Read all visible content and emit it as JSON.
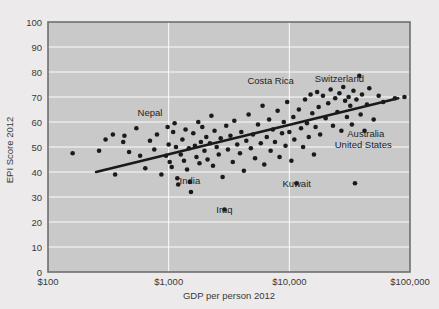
{
  "chart_data": {
    "type": "scatter",
    "title": "",
    "xlabel": "GDP per person 2012",
    "ylabel": "EPI Score 2012",
    "xscale": "log",
    "xlim": [
      100,
      100000
    ],
    "ylim": [
      0,
      100
    ],
    "grid": true,
    "legend": "none",
    "plot_bg": "#c9c9c9",
    "page_bg": "#eceaea",
    "point_color": "#1a1a1a",
    "trendline_color": "#1a1a1a",
    "xticks": [
      "$100",
      "$1,000",
      "$10,000",
      "$100,000"
    ],
    "xtick_values": [
      100,
      1000,
      10000,
      100000
    ],
    "yticks": [
      "0",
      "10",
      "20",
      "30",
      "40",
      "50",
      "60",
      "70",
      "80",
      "90",
      "100"
    ],
    "ytick_values": [
      0,
      10,
      20,
      30,
      40,
      50,
      60,
      70,
      80,
      90,
      100
    ],
    "trendline": {
      "x0": 250,
      "y0": 40.0,
      "x1": 80000,
      "y1": 69.5
    },
    "annotations": [
      {
        "label": "Nepal",
        "x": 700,
        "y": 64.0
      },
      {
        "label": "Costa Rica",
        "x": 7000,
        "y": 76.5
      },
      {
        "label": "Switzerland",
        "x": 26000,
        "y": 77.5
      },
      {
        "label": "Australia",
        "x": 43000,
        "y": 55.5
      },
      {
        "label": "United States",
        "x": 41000,
        "y": 51.0
      },
      {
        "label": "India",
        "x": 1500,
        "y": 36.5
      },
      {
        "label": "Iraq",
        "x": 2900,
        "y": 25.0
      },
      {
        "label": "Kuwait",
        "x": 11500,
        "y": 35.5
      }
    ],
    "points": [
      {
        "x": 160,
        "y": 47.5
      },
      {
        "x": 265,
        "y": 48.5
      },
      {
        "x": 300,
        "y": 53.0
      },
      {
        "x": 345,
        "y": 55.0
      },
      {
        "x": 360,
        "y": 39.0
      },
      {
        "x": 420,
        "y": 52.0
      },
      {
        "x": 430,
        "y": 54.5
      },
      {
        "x": 470,
        "y": 48.0
      },
      {
        "x": 540,
        "y": 57.5
      },
      {
        "x": 580,
        "y": 46.5
      },
      {
        "x": 640,
        "y": 41.5
      },
      {
        "x": 700,
        "y": 52.5
      },
      {
        "x": 760,
        "y": 49.0
      },
      {
        "x": 800,
        "y": 55.0
      },
      {
        "x": 870,
        "y": 39.0
      },
      {
        "x": 950,
        "y": 46.5
      },
      {
        "x": 980,
        "y": 58.0
      },
      {
        "x": 1000,
        "y": 51.0
      },
      {
        "x": 1020,
        "y": 44.0
      },
      {
        "x": 1060,
        "y": 42.0
      },
      {
        "x": 1090,
        "y": 56.0
      },
      {
        "x": 1120,
        "y": 59.5
      },
      {
        "x": 1150,
        "y": 50.0
      },
      {
        "x": 1180,
        "y": 37.5
      },
      {
        "x": 1200,
        "y": 35.0
      },
      {
        "x": 1260,
        "y": 47.0
      },
      {
        "x": 1300,
        "y": 53.0
      },
      {
        "x": 1340,
        "y": 44.5
      },
      {
        "x": 1380,
        "y": 57.0
      },
      {
        "x": 1420,
        "y": 41.0
      },
      {
        "x": 1470,
        "y": 49.5
      },
      {
        "x": 1500,
        "y": 36.0
      },
      {
        "x": 1530,
        "y": 32.0
      },
      {
        "x": 1600,
        "y": 55.5
      },
      {
        "x": 1650,
        "y": 50.5
      },
      {
        "x": 1700,
        "y": 46.0
      },
      {
        "x": 1760,
        "y": 60.0
      },
      {
        "x": 1800,
        "y": 43.5
      },
      {
        "x": 1850,
        "y": 52.0
      },
      {
        "x": 1900,
        "y": 58.0
      },
      {
        "x": 1980,
        "y": 48.5
      },
      {
        "x": 2050,
        "y": 54.0
      },
      {
        "x": 2100,
        "y": 45.0
      },
      {
        "x": 2200,
        "y": 51.5
      },
      {
        "x": 2260,
        "y": 62.5
      },
      {
        "x": 2330,
        "y": 42.5
      },
      {
        "x": 2400,
        "y": 56.5
      },
      {
        "x": 2500,
        "y": 50.0
      },
      {
        "x": 2600,
        "y": 47.0
      },
      {
        "x": 2700,
        "y": 53.5
      },
      {
        "x": 2800,
        "y": 38.0
      },
      {
        "x": 2900,
        "y": 25.0
      },
      {
        "x": 3000,
        "y": 58.5
      },
      {
        "x": 3100,
        "y": 49.0
      },
      {
        "x": 3250,
        "y": 54.5
      },
      {
        "x": 3400,
        "y": 44.0
      },
      {
        "x": 3500,
        "y": 60.5
      },
      {
        "x": 3700,
        "y": 51.0
      },
      {
        "x": 3900,
        "y": 47.5
      },
      {
        "x": 4000,
        "y": 56.0
      },
      {
        "x": 4200,
        "y": 40.5
      },
      {
        "x": 4400,
        "y": 52.5
      },
      {
        "x": 4600,
        "y": 63.0
      },
      {
        "x": 4800,
        "y": 49.5
      },
      {
        "x": 5000,
        "y": 55.0
      },
      {
        "x": 5200,
        "y": 45.5
      },
      {
        "x": 5500,
        "y": 59.0
      },
      {
        "x": 5800,
        "y": 51.5
      },
      {
        "x": 6000,
        "y": 66.5
      },
      {
        "x": 6200,
        "y": 43.0
      },
      {
        "x": 6500,
        "y": 54.0
      },
      {
        "x": 6800,
        "y": 61.0
      },
      {
        "x": 7000,
        "y": 48.5
      },
      {
        "x": 7300,
        "y": 57.0
      },
      {
        "x": 7600,
        "y": 52.0
      },
      {
        "x": 8000,
        "y": 64.5
      },
      {
        "x": 8300,
        "y": 46.0
      },
      {
        "x": 8700,
        "y": 55.5
      },
      {
        "x": 9000,
        "y": 60.0
      },
      {
        "x": 9300,
        "y": 50.5
      },
      {
        "x": 9600,
        "y": 68.0
      },
      {
        "x": 10000,
        "y": 56.0
      },
      {
        "x": 10400,
        "y": 44.5
      },
      {
        "x": 10800,
        "y": 62.0
      },
      {
        "x": 11000,
        "y": 53.0
      },
      {
        "x": 11500,
        "y": 35.5
      },
      {
        "x": 12000,
        "y": 65.0
      },
      {
        "x": 12500,
        "y": 57.5
      },
      {
        "x": 13000,
        "y": 50.0
      },
      {
        "x": 13500,
        "y": 69.0
      },
      {
        "x": 14000,
        "y": 59.5
      },
      {
        "x": 14500,
        "y": 54.0
      },
      {
        "x": 15000,
        "y": 71.0
      },
      {
        "x": 15500,
        "y": 63.5
      },
      {
        "x": 16000,
        "y": 47.0
      },
      {
        "x": 16500,
        "y": 58.0
      },
      {
        "x": 17000,
        "y": 72.0
      },
      {
        "x": 17500,
        "y": 66.0
      },
      {
        "x": 18000,
        "y": 55.0
      },
      {
        "x": 19000,
        "y": 70.5
      },
      {
        "x": 20000,
        "y": 61.5
      },
      {
        "x": 21000,
        "y": 67.5
      },
      {
        "x": 22000,
        "y": 73.0
      },
      {
        "x": 23000,
        "y": 58.5
      },
      {
        "x": 24000,
        "y": 69.5
      },
      {
        "x": 25000,
        "y": 64.0
      },
      {
        "x": 26000,
        "y": 71.5
      },
      {
        "x": 27000,
        "y": 56.5
      },
      {
        "x": 28000,
        "y": 74.0
      },
      {
        "x": 29000,
        "y": 68.5
      },
      {
        "x": 30000,
        "y": 62.0
      },
      {
        "x": 31000,
        "y": 70.0
      },
      {
        "x": 32000,
        "y": 66.5
      },
      {
        "x": 33000,
        "y": 59.0
      },
      {
        "x": 34000,
        "y": 72.5
      },
      {
        "x": 35000,
        "y": 35.5
      },
      {
        "x": 36000,
        "y": 69.0
      },
      {
        "x": 38000,
        "y": 78.5
      },
      {
        "x": 39000,
        "y": 63.0
      },
      {
        "x": 40000,
        "y": 71.0
      },
      {
        "x": 42000,
        "y": 56.5
      },
      {
        "x": 44000,
        "y": 67.0
      },
      {
        "x": 46000,
        "y": 73.5
      },
      {
        "x": 50000,
        "y": 61.0
      },
      {
        "x": 55000,
        "y": 70.5
      },
      {
        "x": 60000,
        "y": 68.0
      },
      {
        "x": 75000,
        "y": 69.5
      },
      {
        "x": 90000,
        "y": 70.0
      }
    ],
    "outlier_point": {
      "x": 950,
      "y": 110.5,
      "note": "point plotted above the plot area"
    }
  }
}
